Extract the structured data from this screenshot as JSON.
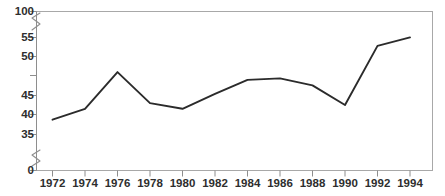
{
  "chart_data": {
    "type": "line",
    "title": "",
    "xlabel": "",
    "ylabel": "",
    "x": [
      1972,
      1974,
      1976,
      1978,
      1980,
      1982,
      1984,
      1986,
      1988,
      1990,
      1992,
      1994
    ],
    "values": [
      38.7,
      41.5,
      48.0,
      43.0,
      41.5,
      45.2,
      47.0,
      47.2,
      46.3,
      42.5,
      52.8,
      55.2
    ],
    "series": [
      {
        "name": "series-1",
        "values": [
          38.7,
          41.5,
          48.0,
          43.0,
          41.5,
          45.2,
          47.0,
          47.2,
          46.3,
          42.5,
          52.8,
          55.2
        ]
      }
    ],
    "xtick_labels": [
      "1972",
      "1974",
      "1976",
      "1978",
      "1980",
      "1982",
      "1984",
      "1986",
      "1988",
      "1990",
      "1992",
      "1994"
    ],
    "ytick_labels": [
      "100",
      "55",
      "50",
      "45",
      "40",
      "35",
      "0"
    ],
    "ytick_values": [
      100,
      55,
      50,
      45,
      40,
      35,
      0
    ],
    "ylim": [
      0,
      100
    ],
    "xlim": [
      1971,
      1995
    ],
    "grid": false,
    "legend": false,
    "axis_breaks": [
      {
        "between": [
          0,
          35
        ]
      },
      {
        "between": [
          55,
          100
        ]
      }
    ],
    "line_color": "#2b2b2b",
    "frame_color": "#9a9a9a",
    "text_color": "#2e2e2e"
  }
}
